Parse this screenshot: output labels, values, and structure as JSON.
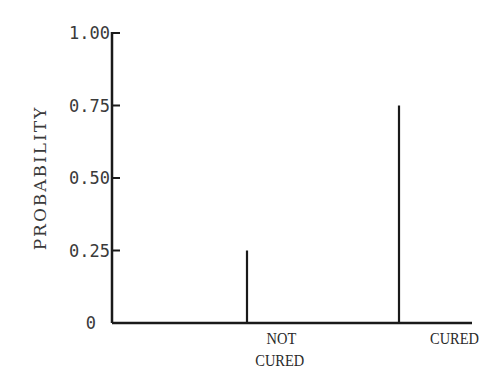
{
  "chart_data": {
    "type": "bar",
    "style": "spike",
    "title": "",
    "xlabel": "",
    "ylabel": "PROBABILITY",
    "categories": [
      [
        "NOT",
        "CURED"
      ],
      [
        "CURED"
      ]
    ],
    "values": [
      0.25,
      0.75
    ],
    "ylim": [
      0,
      1.0
    ],
    "yticks": [
      0,
      0.25,
      0.5,
      0.75,
      1.0
    ],
    "ytick_labels": [
      "0",
      "0.25",
      "0.50",
      "0.75",
      "1.00"
    ],
    "grid": false,
    "legend": null,
    "colors": {
      "axis": "#1a1a1a",
      "bar": "#1a1a1a",
      "text": "#3a3a3a"
    }
  }
}
